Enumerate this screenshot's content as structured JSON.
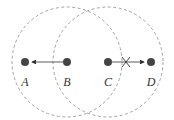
{
  "diagram": {
    "colors": {
      "node": "#444444",
      "range_circle": "#8a8a8a",
      "arrow": "#333333",
      "background": "#ffffff"
    },
    "range_circles": [
      {
        "id": "range-B",
        "cx": 67,
        "cy": 62,
        "r": 55,
        "style": "dashed"
      },
      {
        "id": "range-C",
        "cx": 108,
        "cy": 62,
        "r": 55,
        "style": "dashed"
      }
    ],
    "nodes": [
      {
        "id": "A",
        "label": "A",
        "x": 25,
        "y": 62
      },
      {
        "id": "B",
        "label": "B",
        "x": 67,
        "y": 62
      },
      {
        "id": "C",
        "label": "C",
        "x": 108,
        "y": 62
      },
      {
        "id": "D",
        "label": "D",
        "x": 151,
        "y": 62
      }
    ],
    "edges": [
      {
        "from": "B",
        "to": "A",
        "type": "arrow",
        "blocked": false
      },
      {
        "from": "C",
        "to": "D",
        "type": "arrow",
        "blocked": true,
        "blocked_marker": "x"
      }
    ]
  }
}
